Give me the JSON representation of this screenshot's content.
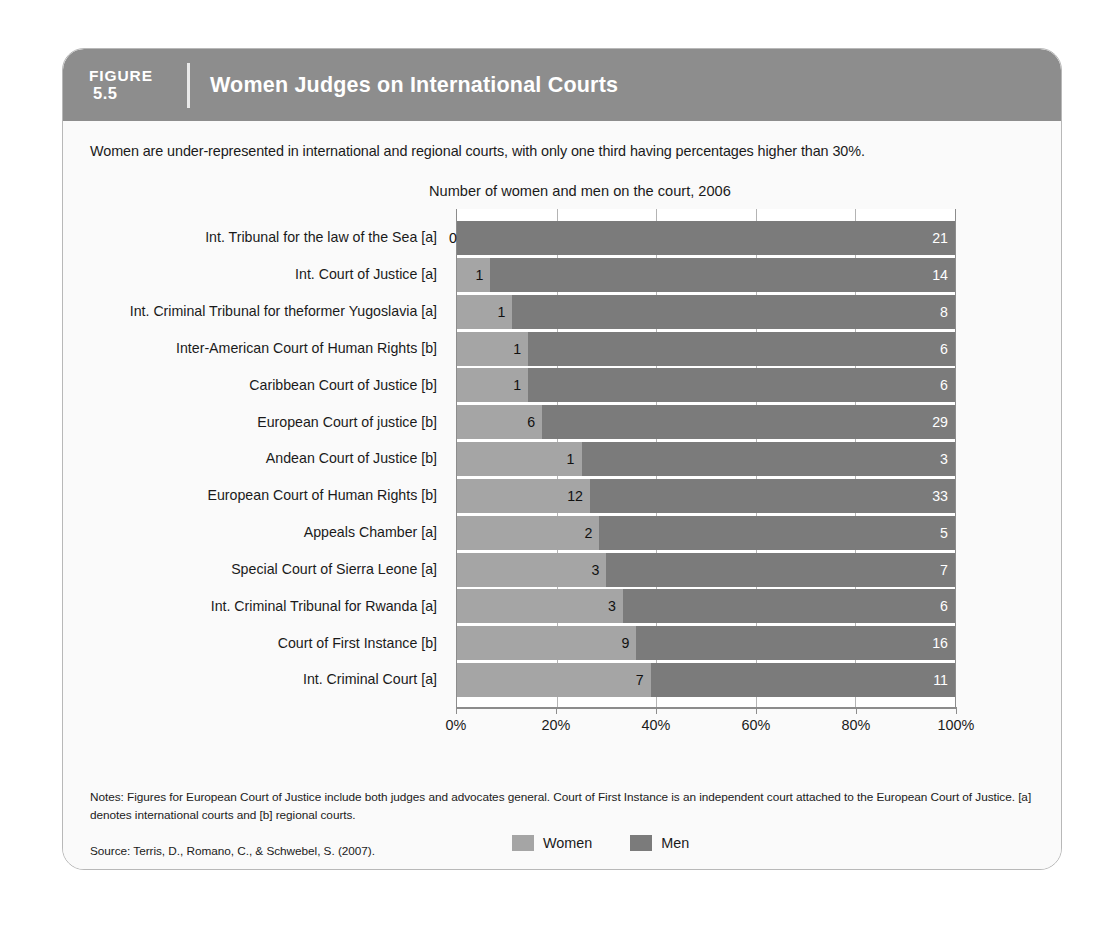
{
  "figure": {
    "label_word": "FIGURE",
    "number": "5.5",
    "title": "Women Judges on International Courts",
    "subtitle": "Women are under-represented in international and regional courts, with only one third having percentages higher than 30%.",
    "notes": "Notes: Figures for European Court of Justice include both judges and advocates general. Court of First Instance is an independent court attached to the European Court of Justice. [a] denotes international courts and [b] regional courts.",
    "source": "Source: Terris, D., Romano, C., & Schwebel, S. (2007)."
  },
  "colors": {
    "header_band": "#8d8d8d",
    "women": "#a5a5a5",
    "men": "#7b7b7b",
    "card_background": "#fafafa",
    "plot_background": "#ffffff"
  },
  "chart_data": {
    "type": "bar",
    "orientation": "horizontal",
    "stacked": true,
    "normalized": true,
    "title": "Number of women and men on the court, 2006",
    "xlabel": "",
    "ylabel": "",
    "xlim": [
      0,
      100
    ],
    "xticks": [
      0,
      20,
      40,
      60,
      80,
      100
    ],
    "xtick_labels": [
      "0%",
      "20%",
      "40%",
      "60%",
      "80%",
      "100%"
    ],
    "grid": true,
    "legend_position": "bottom",
    "categories": [
      "Int. Tribunal for the law of the Sea [a]",
      "Int. Court of Justice [a]",
      "Int. Criminal Tribunal for the former Yugoslavia [a]",
      "Inter-American Court of Human Rights [b]",
      "Caribbean Court of Justice [b]",
      "European Court of justice [b]",
      "Andean Court of Justice [b]",
      "European Court of Human Rights [b]",
      "Appeals Chamber [a]",
      "Special Court of Sierra Leone [a]",
      "Int. Criminal Tribunal for Rwanda [a]",
      "Court of First Instance [b]",
      "Int. Criminal Court [a]"
    ],
    "category_lines": [
      [
        "Int. Tribunal for the law of the Sea [a]"
      ],
      [
        "Int. Court of Justice [a]"
      ],
      [
        "Int. Criminal Tribunal for the",
        "former Yugoslavia [a]"
      ],
      [
        "Inter-American Court of Human Rights [b]"
      ],
      [
        "Caribbean Court of Justice [b]"
      ],
      [
        "European Court of justice [b]"
      ],
      [
        "Andean Court of Justice [b]"
      ],
      [
        "European Court of Human Rights [b]"
      ],
      [
        "Appeals Chamber [a]"
      ],
      [
        "Special Court of Sierra Leone [a]"
      ],
      [
        "Int. Criminal Tribunal for Rwanda [a]"
      ],
      [
        "Court of First Instance [b]"
      ],
      [
        "Int. Criminal Court [a]"
      ]
    ],
    "series": [
      {
        "name": "Women",
        "color": "#a5a5a5",
        "values": [
          0,
          1,
          1,
          1,
          1,
          6,
          1,
          12,
          2,
          3,
          3,
          9,
          7
        ]
      },
      {
        "name": "Men",
        "color": "#7b7b7b",
        "values": [
          21,
          14,
          8,
          6,
          6,
          29,
          3,
          33,
          5,
          7,
          6,
          16,
          11
        ]
      }
    ],
    "rows": [
      {
        "category": "Int. Tribunal for the law of the Sea [a]",
        "women": 0,
        "men": 21,
        "women_pct": 0.0,
        "men_pct": 100.0
      },
      {
        "category": "Int. Court of Justice [a]",
        "women": 1,
        "men": 14,
        "women_pct": 6.7,
        "men_pct": 93.3
      },
      {
        "category": "Int. Criminal Tribunal for the former Yugoslavia [a]",
        "women": 1,
        "men": 8,
        "women_pct": 11.1,
        "men_pct": 88.9
      },
      {
        "category": "Inter-American Court of Human Rights [b]",
        "women": 1,
        "men": 6,
        "women_pct": 14.3,
        "men_pct": 85.7
      },
      {
        "category": "Caribbean Court of Justice [b]",
        "women": 1,
        "men": 6,
        "women_pct": 14.3,
        "men_pct": 85.7
      },
      {
        "category": "European Court of justice [b]",
        "women": 6,
        "men": 29,
        "women_pct": 17.1,
        "men_pct": 82.9
      },
      {
        "category": "Andean Court of Justice [b]",
        "women": 1,
        "men": 3,
        "women_pct": 25.0,
        "men_pct": 75.0
      },
      {
        "category": "European Court of Human Rights [b]",
        "women": 12,
        "men": 33,
        "women_pct": 26.7,
        "men_pct": 73.3
      },
      {
        "category": "Appeals Chamber [a]",
        "women": 2,
        "men": 5,
        "women_pct": 28.6,
        "men_pct": 71.4
      },
      {
        "category": "Special Court of Sierra Leone [a]",
        "women": 3,
        "men": 7,
        "women_pct": 30.0,
        "men_pct": 70.0
      },
      {
        "category": "Int. Criminal Tribunal for Rwanda [a]",
        "women": 3,
        "men": 6,
        "women_pct": 33.3,
        "men_pct": 66.7
      },
      {
        "category": "Court of First Instance [b]",
        "women": 9,
        "men": 16,
        "women_pct": 36.0,
        "men_pct": 64.0
      },
      {
        "category": "Int. Criminal Court [a]",
        "women": 7,
        "men": 11,
        "women_pct": 38.9,
        "men_pct": 61.1
      }
    ],
    "legend": [
      {
        "label": "Women",
        "color": "#a5a5a5"
      },
      {
        "label": "Men",
        "color": "#7b7b7b"
      }
    ]
  }
}
